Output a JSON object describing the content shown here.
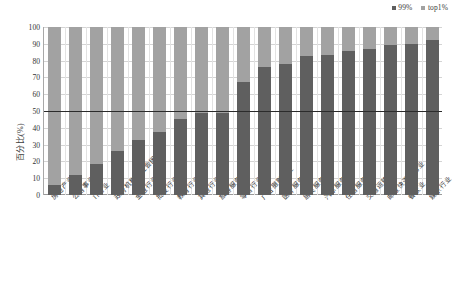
{
  "chart_data": {
    "type": "bar",
    "subtype": "stacked-bar-100-percent",
    "title": "",
    "xlabel": "",
    "ylabel": "百分比(%)",
    "ylim": [
      0,
      100
    ],
    "yticks": [
      100,
      90,
      80,
      70,
      60,
      50,
      40,
      30,
      20,
      10,
      0
    ],
    "grid": true,
    "legend_position": "top-right",
    "categories": [
      "房地产业",
      "公用事业",
      "IT行业",
      "政府机构及社会团体",
      "金融行业",
      "批发行业",
      "教育行业",
      "其他行业",
      "旅游服务业",
      "零售行业",
      "广告摄影行业",
      "医疗服务业",
      "居民服务业",
      "汽车服务",
      "住宿服务业",
      "交通运输业",
      "邮政快递服务业",
      "餐饮业",
      "娱乐行业"
    ],
    "series": [
      {
        "name": "99%",
        "color": "#5f5f5f",
        "values": [
          6,
          12,
          18.5,
          26,
          33,
          37.5,
          45,
          49,
          49,
          67,
          76,
          78,
          83,
          83.5,
          85.5,
          87,
          89.5,
          90,
          92
        ]
      },
      {
        "name": "top1%",
        "color": "#a2a2a2",
        "values": [
          94,
          88,
          81.5,
          74,
          67,
          62.5,
          55,
          51,
          51,
          33,
          24,
          22,
          17,
          16.5,
          14.5,
          13,
          10.5,
          10,
          8
        ]
      }
    ],
    "annotations": [
      {
        "type": "reference-line",
        "orientation": "horizontal",
        "value": 50,
        "color": "#2b2b2b"
      }
    ]
  },
  "legend": {
    "entries": [
      {
        "label": "99%",
        "color": "#5f5f5f"
      },
      {
        "label": "top1%",
        "color": "#a2a2a2"
      }
    ]
  },
  "axes": {
    "y_title": "百分比(%)"
  }
}
